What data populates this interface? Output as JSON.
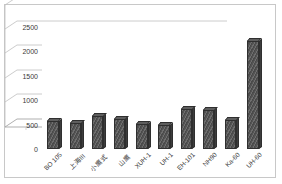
{
  "chart_data": {
    "type": "bar",
    "title": "",
    "subtitle": "",
    "xlabel": "",
    "ylabel": "",
    "legend": [],
    "legend_position": "none",
    "grid": true,
    "style": "3d-column",
    "ylim": [
      0,
      2500
    ],
    "yticks": [
      0,
      500,
      1000,
      1500,
      2000,
      2500
    ],
    "ytick_labels": [
      "0",
      "500",
      "1000",
      "1500",
      "2000",
      "2500"
    ],
    "categories": [
      "BO 105",
      "上海III",
      "小鹰式",
      "山鹰",
      "XUH-1",
      "UH-1",
      "EH-101",
      "NH90",
      "Ka-60",
      "UH-60"
    ],
    "values": [
      580,
      530,
      670,
      620,
      510,
      490,
      810,
      790,
      600,
      2210
    ],
    "series": [
      {
        "name": "",
        "values": [
          580,
          530,
          670,
          620,
          510,
          490,
          810,
          790,
          600,
          2210
        ]
      }
    ]
  },
  "colors": {
    "bar_fill": "#5e5e5e",
    "bar_outline": "#2f2f2f",
    "gridline": "#bfbfbf",
    "axis": "#a6a6a6",
    "frame": "#c8c8c8",
    "text": "#3a3a3a",
    "background": "#ffffff"
  }
}
